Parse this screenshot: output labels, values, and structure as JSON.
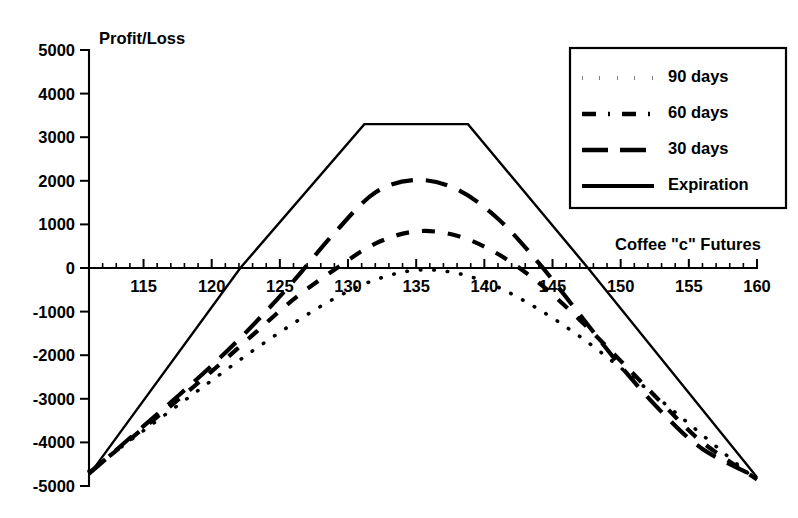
{
  "chart_data": {
    "type": "line",
    "title": "",
    "xlabel": "Coffee \"c\" Futures",
    "ylabel": "Profit/Loss",
    "xlim": [
      111,
      160
    ],
    "ylim": [
      -5000,
      5000
    ],
    "grid": false,
    "legend_position": "top-right",
    "x_ticks": [
      115,
      120,
      125,
      130,
      135,
      140,
      145,
      150,
      155,
      160
    ],
    "x_minor_step": 1,
    "y_ticks": [
      5000,
      4000,
      3000,
      2000,
      1000,
      0,
      -1000,
      -2000,
      -3000,
      -4000,
      -5000
    ],
    "x_tick_labels": [
      "115",
      "120",
      "125",
      "130",
      "135",
      "140",
      "145",
      "150",
      "155",
      "160"
    ],
    "y_tick_labels": [
      "5000",
      "4000",
      "3000",
      "2000",
      "1000",
      "0",
      "-1000",
      "-2000",
      "-3000",
      "-4000",
      "-5000"
    ],
    "series": [
      {
        "name": "90 days",
        "style": "dotted",
        "x": [
          111,
          114,
          117,
          120,
          123,
          126,
          129,
          132,
          135,
          138,
          141,
          144,
          147,
          150,
          153,
          156,
          160
        ],
        "values": [
          -4660,
          -3960,
          -3270,
          -2580,
          -1900,
          -1270,
          -700,
          -270,
          -50,
          -120,
          -440,
          -950,
          -1570,
          -2290,
          -3050,
          -3830,
          -4880
        ]
      },
      {
        "name": "60 days",
        "style": "dash-dot",
        "x": [
          111,
          114,
          117,
          120,
          123,
          126,
          129,
          132,
          135,
          138,
          141,
          144,
          147,
          150,
          153,
          156,
          160
        ],
        "values": [
          -4700,
          -3930,
          -3160,
          -2370,
          -1540,
          -720,
          -40,
          560,
          840,
          740,
          320,
          -340,
          -1190,
          -2130,
          -3090,
          -4000,
          -4850
        ]
      },
      {
        "name": "30 days",
        "style": "dashed",
        "x": [
          111,
          114,
          117,
          120,
          123,
          126,
          129,
          132,
          135,
          138,
          141,
          144,
          147,
          150,
          153,
          156,
          160
        ],
        "values": [
          -4720,
          -3900,
          -3080,
          -2240,
          -1320,
          -300,
          800,
          1730,
          2020,
          1800,
          1130,
          110,
          -1070,
          -2250,
          -3300,
          -4150,
          -4800
        ]
      },
      {
        "name": "Expiration",
        "style": "solid",
        "x": [
          111,
          122.1,
          131.2,
          138.8,
          147.6,
          160
        ],
        "values": [
          -4750,
          0,
          3300,
          3300,
          0,
          -4800
        ]
      }
    ],
    "legend": [
      {
        "label": "90 days",
        "style": "dotted"
      },
      {
        "label": "60 days",
        "style": "dash-dot"
      },
      {
        "label": "30 days",
        "style": "dashed"
      },
      {
        "label": "Expiration",
        "style": "solid"
      }
    ]
  }
}
